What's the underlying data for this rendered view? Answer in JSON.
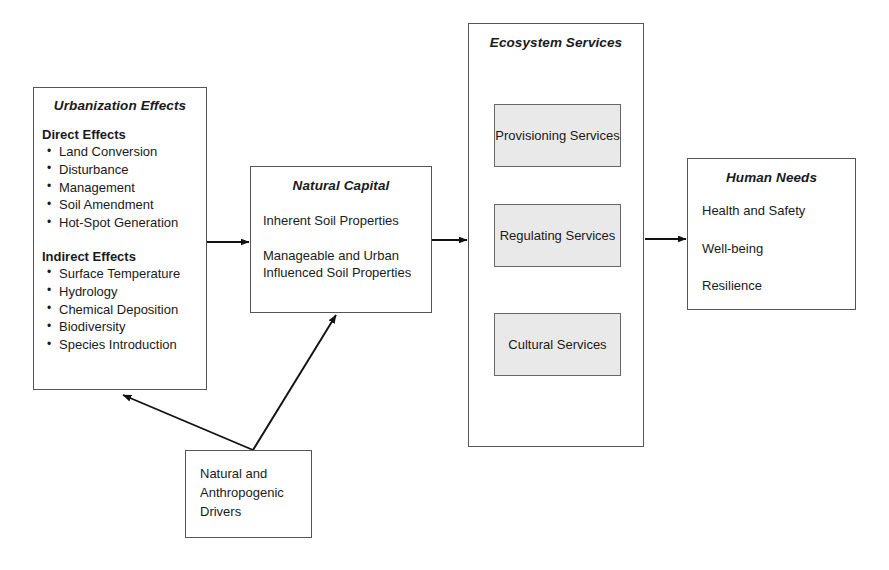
{
  "diagram": {
    "type": "flow-diagram",
    "nodes": {
      "urbanization_effects": {
        "title": "Urbanization Effects",
        "groups": [
          {
            "heading": "Direct Effects",
            "items": [
              "Land Conversion",
              "Disturbance",
              "Management",
              "Soil Amendment",
              "Hot-Spot Generation"
            ]
          },
          {
            "heading": "Indirect Effects",
            "items": [
              "Surface Temperature",
              "Hydrology",
              "Chemical Deposition",
              "Biodiversity",
              "Species Introduction"
            ]
          }
        ]
      },
      "natural_capital": {
        "title": "Natural Capital",
        "lines": [
          "Inherent Soil Properties",
          "Manageable and Urban Influenced Soil Properties"
        ]
      },
      "ecosystem_services": {
        "title": "Ecosystem Services",
        "services": [
          {
            "label": "Provisioning Services"
          },
          {
            "label": "Regulating Services"
          },
          {
            "label": "Cultural Services"
          }
        ]
      },
      "human_needs": {
        "title": "Human Needs",
        "lines": [
          "Health and Safety",
          "Well-being",
          "Resilience"
        ]
      },
      "drivers": {
        "lines": [
          "Natural and",
          "Anthropogenic",
          "Drivers"
        ]
      }
    },
    "connectors": [
      {
        "name": "urbanization-to-natural-capital",
        "from": "urbanization_effects",
        "to": "natural_capital",
        "style": "straight-arrow"
      },
      {
        "name": "natural-capital-to-ecosystem-services",
        "from": "natural_capital",
        "to": "ecosystem_services",
        "style": "straight-arrow"
      },
      {
        "name": "ecosystem-services-to-human-needs",
        "from": "ecosystem_services",
        "to": "human_needs",
        "style": "straight-arrow"
      },
      {
        "name": "drivers-to-urbanization-effects",
        "from": "drivers",
        "to": "urbanization_effects",
        "style": "diagonal-arrow"
      },
      {
        "name": "drivers-to-natural-capital",
        "from": "drivers",
        "to": "natural_capital",
        "style": "diagonal-arrow"
      }
    ],
    "colors": {
      "background": "#ffffff",
      "box_border": "#555555",
      "service_box_fill": "#e9e9e9",
      "connector": "#111111",
      "text": "#1a1a1a"
    }
  }
}
